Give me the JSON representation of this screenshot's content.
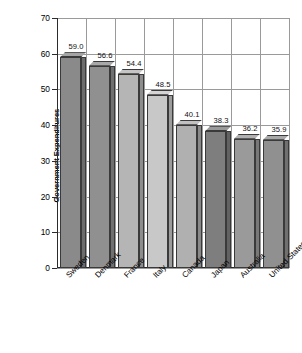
{
  "chart_data": {
    "type": "bar",
    "title": "",
    "xlabel": "",
    "ylabel_line1": "Government Expenditures",
    "ylabel_line2": "as Percentage of Gross Domestic Product",
    "categories": [
      "Sweden",
      "Denmark",
      "France",
      "Italy",
      "Canada",
      "Japan",
      "Australia",
      "United States"
    ],
    "values": [
      59.0,
      56.6,
      54.4,
      48.5,
      40.1,
      38.3,
      36.2,
      35.9
    ],
    "value_labels": [
      "59.0",
      "56.6",
      "54.4",
      "48.5",
      "40.1",
      "38.3",
      "36.2",
      "35.9"
    ],
    "bar_colors": [
      "#8a8a8a",
      "#909090",
      "#b5b5b5",
      "#c8c8c8",
      "#b0b0b0",
      "#7e7e7e",
      "#9a9a9a",
      "#909090"
    ],
    "ylim": [
      0,
      70
    ],
    "yticks": [
      0,
      10,
      20,
      30,
      40,
      50,
      60,
      70
    ],
    "ytick_labels": [
      "0",
      "10",
      "20",
      "30",
      "40",
      "50",
      "60",
      "70"
    ],
    "grid": true,
    "legend": "none",
    "style": "3d-bar-grayscale"
  }
}
